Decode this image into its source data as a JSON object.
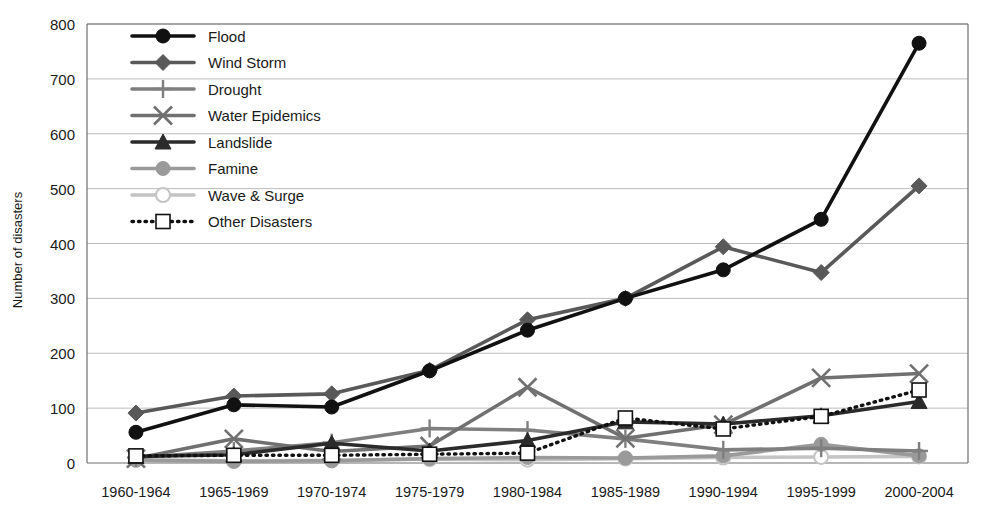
{
  "chart_data": {
    "type": "line",
    "title": "",
    "xlabel": "",
    "ylabel": "Number of disasters",
    "ylim": [
      0,
      800
    ],
    "ytick_step": 100,
    "yticks": [
      "0",
      "100",
      "200",
      "300",
      "400",
      "500",
      "600",
      "700",
      "800"
    ],
    "grid": "horizontal",
    "legend_position": "inside-top-left",
    "categories": [
      "1960-1964",
      "1965-1969",
      "1970-1974",
      "1975-1979",
      "1980-1984",
      "1985-1989",
      "1990-1994",
      "1995-1999",
      "2000-2004"
    ],
    "series": [
      {
        "name": "Flood",
        "marker": "circle",
        "color": "#111111",
        "line_style": "solid",
        "values": [
          56,
          106,
          102,
          168,
          242,
          300,
          352,
          444,
          765
        ]
      },
      {
        "name": "Wind Storm",
        "marker": "diamond",
        "color": "#595959",
        "line_style": "solid",
        "values": [
          91,
          122,
          126,
          169,
          261,
          300,
          394,
          347,
          505
        ]
      },
      {
        "name": "Drought",
        "marker": "plus",
        "color": "#7f7f7f",
        "line_style": "solid",
        "values": [
          10,
          22,
          37,
          63,
          60,
          44,
          24,
          27,
          22
        ]
      },
      {
        "name": "Water Epidemics",
        "marker": "x",
        "color": "#707070",
        "line_style": "solid",
        "values": [
          8,
          44,
          21,
          31,
          138,
          45,
          70,
          155,
          163
        ]
      },
      {
        "name": "Landslide",
        "marker": "triangle",
        "color": "#2b2b2b",
        "line_style": "solid",
        "values": [
          12,
          15,
          36,
          22,
          41,
          75,
          71,
          86,
          112
        ]
      },
      {
        "name": "Famine",
        "marker": "circle",
        "color": "#9a9a9a",
        "line_style": "solid",
        "values": [
          5,
          3,
          4,
          8,
          10,
          9,
          13,
          34,
          13
        ]
      },
      {
        "name": "Wave & Surge",
        "marker": "open-circle",
        "color": "#c4c4c4",
        "line_style": "solid",
        "values": [
          6,
          4,
          5,
          7,
          6,
          8,
          10,
          11,
          12
        ]
      },
      {
        "name": "Other Disasters",
        "marker": "open-square",
        "color": "#111111",
        "line_style": "dotted",
        "values": [
          13,
          14,
          14,
          16,
          18,
          82,
          62,
          85,
          133
        ]
      }
    ]
  },
  "axis": {
    "y_title": "Number of disasters"
  },
  "legend": {
    "items": [
      {
        "label": "Flood"
      },
      {
        "label": "Wind Storm"
      },
      {
        "label": "Drought"
      },
      {
        "label": "Water Epidemics"
      },
      {
        "label": "Landslide"
      },
      {
        "label": "Famine"
      },
      {
        "label": "Wave & Surge"
      },
      {
        "label": "Other Disasters"
      }
    ]
  },
  "style": {
    "plot_background": "#ffffff",
    "grid_color": "#bcbcbc",
    "axis_color": "#6e6e6e"
  }
}
